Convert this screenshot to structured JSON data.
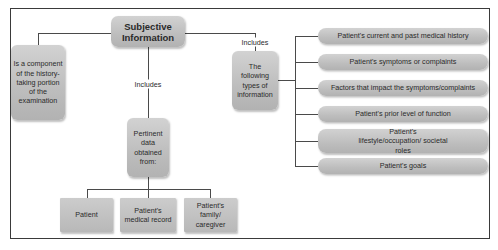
{
  "diagram": {
    "root": {
      "label": "Subjective\nInformation"
    },
    "left_node": {
      "label": "Is a component of the history-taking portion of the examination"
    },
    "middle_edge_label": "Includes",
    "middle_node": {
      "label": "Pertinent data obtained from:"
    },
    "sources": [
      {
        "label": "Patient"
      },
      {
        "label": "Patient's medical record"
      },
      {
        "label": "Patient's family/ caregiver"
      }
    ],
    "right_edge_label": "Includes",
    "right_node": {
      "label": "The following types of information"
    },
    "types": [
      {
        "label": "Patient's current and past medical history"
      },
      {
        "label": "Patient's symptoms or complaints"
      },
      {
        "label": "Factors that impact the symptoms/complaints"
      },
      {
        "label": "Patient's prior level of function"
      },
      {
        "label": "Patient's lifestyle/occupation/ societal roles"
      },
      {
        "label": "Patient's goals"
      }
    ]
  },
  "colors": {
    "box_fill": "#c0c0c0",
    "line": "#4a4a4a",
    "frame": "#3a3a3a",
    "text": "#2a2a2a"
  }
}
